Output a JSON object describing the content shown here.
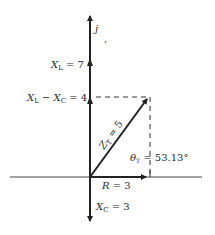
{
  "diagram": {
    "axis_j_label": "j",
    "xl_label": "X",
    "xl_sub": "L",
    "xl_value": " = 7",
    "xlxc_label": "X",
    "xlxc_sub1": "L",
    "xlxc_mid": " − X",
    "xlxc_sub2": "C",
    "xlxc_value": " = 4",
    "zt_label": "Z",
    "zt_sub": "T",
    "zt_value": " = 5",
    "theta_label": "θ",
    "theta_sub": "T",
    "theta_value": " = 53.13°",
    "r_label": "R",
    "r_value": " = 3",
    "xc_label": "X",
    "xc_sub": "C",
    "xc_value": " = 3"
  }
}
